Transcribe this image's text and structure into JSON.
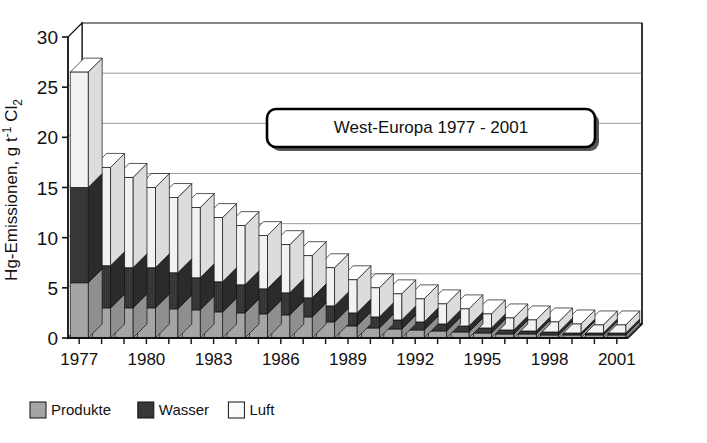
{
  "chart_data": {
    "type": "bar",
    "subtype": "stacked-bar-3d",
    "title": "West-Europa 1977 - 2001",
    "xlabel": "",
    "ylabel": "Hg-Emissionen, g t-1 Cl2",
    "ylabel_parts": {
      "prefix": "Hg-Emissionen, g t",
      "sup": "-1",
      "mid": " Cl",
      "sub": "2"
    },
    "ylim": [
      0,
      30
    ],
    "ytick_values": [
      0,
      5,
      10,
      15,
      20,
      25,
      30
    ],
    "ytick_labels": [
      "0",
      "5",
      "10",
      "15",
      "20",
      "25",
      "30"
    ],
    "grid": true,
    "grid_axis": "y",
    "legend_position": "bottom-left",
    "stack_order_bottom_to_top": [
      "Produkte",
      "Wasser",
      "Luft"
    ],
    "categories": [
      "1977",
      "1978",
      "1979",
      "1980",
      "1981",
      "1982",
      "1983",
      "1984",
      "1985",
      "1986",
      "1987",
      "1988",
      "1989",
      "1990",
      "1991",
      "1992",
      "1993",
      "1994",
      "1995",
      "1996",
      "1997",
      "1998",
      "1999",
      "2000",
      "2001"
    ],
    "xtick_labels_shown": [
      "1977",
      "1980",
      "1983",
      "1986",
      "1989",
      "1992",
      "1995",
      "1998",
      "2001"
    ],
    "series": [
      {
        "name": "Produkte",
        "color": "#a8a8a8",
        "side_color": "#8f8f8f",
        "top_color": "#c0c0c0",
        "values": [
          5.5,
          3.0,
          3.0,
          3.0,
          2.9,
          2.8,
          2.6,
          2.5,
          2.4,
          2.3,
          2.1,
          1.6,
          1.2,
          1.0,
          0.9,
          0.8,
          0.7,
          0.6,
          0.5,
          0.4,
          0.4,
          0.3,
          0.3,
          0.3,
          0.3
        ]
      },
      {
        "name": "Wasser",
        "color": "#3a3a3a",
        "side_color": "#2b2b2b",
        "top_color": "#585858",
        "values": [
          9.5,
          4.2,
          4.0,
          4.0,
          3.6,
          3.2,
          3.0,
          2.8,
          2.5,
          2.2,
          1.9,
          1.6,
          1.3,
          1.1,
          0.9,
          0.8,
          0.7,
          0.6,
          0.5,
          0.4,
          0.3,
          0.3,
          0.2,
          0.2,
          0.2
        ]
      },
      {
        "name": "Luft",
        "color": "#f2f2f2",
        "side_color": "#dcdcdc",
        "top_color": "#ffffff",
        "values": [
          11.5,
          9.8,
          9.0,
          8.0,
          7.5,
          7.0,
          6.4,
          5.9,
          5.3,
          4.8,
          4.2,
          3.8,
          3.3,
          2.9,
          2.6,
          2.3,
          2.0,
          1.7,
          1.4,
          1.2,
          1.1,
          1.0,
          0.9,
          0.8,
          0.8
        ]
      }
    ],
    "totals": [
      26.5,
      17.0,
      16.0,
      15.0,
      14.0,
      13.0,
      12.0,
      11.2,
      10.2,
      9.3,
      8.2,
      7.0,
      5.8,
      5.0,
      4.4,
      3.9,
      3.4,
      2.9,
      2.4,
      2.0,
      1.8,
      1.6,
      1.4,
      1.3,
      1.3
    ],
    "annotations": [
      {
        "name": "title-box",
        "text": "West-Europa 1977 - 2001"
      }
    ]
  },
  "legend": {
    "items": [
      {
        "label": "Produkte",
        "swatch": "#a8a8a8"
      },
      {
        "label": "Wasser",
        "swatch": "#3a3a3a"
      },
      {
        "label": "Luft",
        "swatch": "#fbfbfb"
      }
    ]
  },
  "colors": {
    "axis": "#111111",
    "grid": "#9a9a9a",
    "floor": "#b8b8b8",
    "background": "#ffffff"
  }
}
